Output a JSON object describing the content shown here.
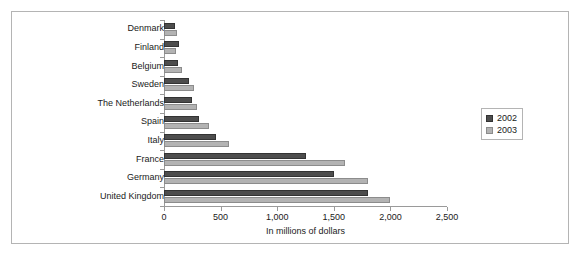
{
  "chart_data": {
    "type": "bar",
    "orientation": "horizontal",
    "title": "",
    "xlabel": "In millions of dollars",
    "ylabel": "",
    "xlim": [
      0,
      2500
    ],
    "xticks": [
      "0",
      "500",
      "1,000",
      "1,500",
      "2,000",
      "2,500"
    ],
    "xtick_values": [
      0,
      500,
      1000,
      1500,
      2000,
      2500
    ],
    "grid": false,
    "legend_position": "right",
    "categories": [
      "Denmark",
      "Finland",
      "Belgium",
      "Sweden",
      "The Netherlands",
      "Spain",
      "Italy",
      "France",
      "Germany",
      "United Kingdom"
    ],
    "series": [
      {
        "name": "2002",
        "color": "#4d4d4d",
        "values": [
          100,
          130,
          125,
          220,
          250,
          310,
          460,
          1250,
          1500,
          1800
        ]
      },
      {
        "name": "2003",
        "color": "#b3b3b3",
        "values": [
          115,
          110,
          160,
          265,
          290,
          400,
          570,
          1600,
          1800,
          2000
        ]
      }
    ]
  },
  "legend": {
    "entries": [
      {
        "label": "2002"
      },
      {
        "label": "2003"
      }
    ]
  }
}
